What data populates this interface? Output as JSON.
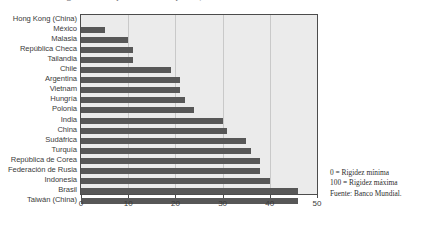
{
  "title": "Índice de rigidez del empleo en ciertos países, 2007",
  "note": {
    "min_label": "0 = Rigidez mínima",
    "max_label": "100 = Rigidez máxima",
    "source": "Fuente: Banco Mundial."
  },
  "axis": {
    "ticks": [
      0,
      10,
      20,
      30,
      40,
      50
    ],
    "tick_labels": [
      "0",
      "10",
      "20",
      "30",
      "40",
      "50"
    ]
  },
  "colors": {
    "bar": "#575757",
    "plot_background": "#ebebeb",
    "frame": "#4c4c4c",
    "gridline": "#c9c9c9",
    "label_text": "#3b3b3b"
  },
  "chart_data": {
    "type": "bar",
    "orientation": "horizontal",
    "title": "Índice de rigidez del empleo en ciertos países, 2007",
    "xlabel": "",
    "ylabel": "",
    "xlim": [
      0,
      50
    ],
    "grid": true,
    "legend": false,
    "categories": [
      "Hong Kong (China)",
      "México",
      "Malasia",
      "República Checa",
      "Tailandia",
      "Chile",
      "Argentina",
      "Vietnam",
      "Hungría",
      "Polonia",
      "India",
      "China",
      "Sudáfrica",
      "Turquía",
      "República de Corea",
      "Federación de Rusia",
      "Indonesia",
      "Brasil",
      "Taiwán (China)"
    ],
    "values": [
      0,
      5,
      10,
      11,
      11,
      19,
      21,
      21,
      22,
      24,
      30,
      31,
      35,
      36,
      38,
      38,
      40,
      46,
      46
    ],
    "annotations": [
      "0 = Rigidez mínima",
      "100 = Rigidez máxima",
      "Fuente: Banco Mundial."
    ]
  }
}
